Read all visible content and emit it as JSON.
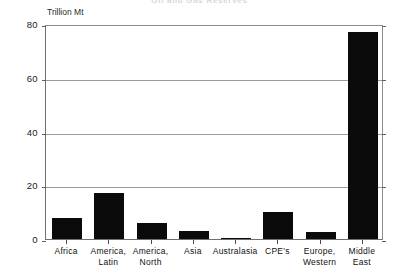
{
  "chart_data": {
    "type": "bar",
    "title": "Oil and Gas Reserves",
    "categories": [
      "Africa",
      "America, Latin",
      "America, North",
      "Asia",
      "Australasia",
      "CPE's",
      "Europe, Western",
      "Middle East"
    ],
    "category_lines": [
      [
        "Africa"
      ],
      [
        "America,",
        "Latin"
      ],
      [
        "America,",
        "North"
      ],
      [
        "Asia"
      ],
      [
        "Australasia"
      ],
      [
        "CPE's"
      ],
      [
        "Europe,",
        "Western"
      ],
      [
        "Middle",
        "East"
      ]
    ],
    "values": [
      8,
      17,
      6,
      3,
      0.5,
      10,
      2.5,
      77
    ],
    "xlabel": "",
    "ylabel": "Trillion Mt",
    "ylim": [
      0,
      80
    ],
    "yticks": [
      0,
      20,
      40,
      60,
      80
    ],
    "ytick_labels": [
      "0",
      "20",
      "40",
      "60",
      "80"
    ],
    "grid": true,
    "legend": false,
    "bar_color": "#0a0a0a",
    "grid_color": "#9a9a9a",
    "axis_color": "#6f6f6f",
    "background": "#ffffff"
  }
}
